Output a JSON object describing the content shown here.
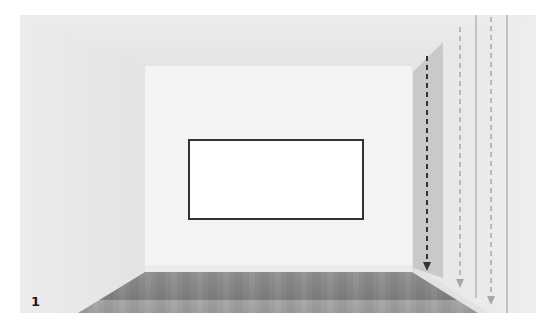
{
  "figure": {
    "panel_label": "1",
    "colors": {
      "wall_back": "#f2f2f2",
      "wall_side": "#e9e9e9",
      "ceiling": "#ebebeb",
      "floor": "#8f8f8f",
      "frame_border": "#333333",
      "frame_fill": "#ffffff",
      "panel": "#c9c9c9",
      "arrow_dark": "#333333",
      "arrow_light": "#a8a8a8",
      "guide_line": "#9a9a9a"
    },
    "elements": {
      "frame": "rectangle-on-back-wall",
      "arrows": [
        "dark-dashed-arrow",
        "light-dashed-arrow-1",
        "light-dashed-arrow-2"
      ],
      "guide_lines": [
        "vertical-guide-1",
        "vertical-guide-2"
      ]
    }
  }
}
